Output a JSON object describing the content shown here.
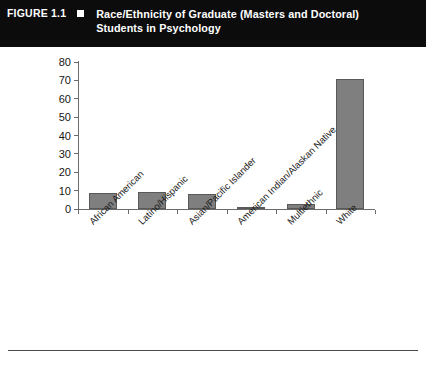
{
  "figure": {
    "number": "FIGURE 1.1",
    "bullet_icon": "square-bullet-icon",
    "title": "Race/Ethnicity of Graduate (Masters and Doctoral) Students in Psychology",
    "title_line_1": "Race/Ethnicity of Graduate (Masters and Doctoral)",
    "title_line_2": "Students in Psychology",
    "banner_background": "#0c0c0c",
    "banner_text_color": "#ffffff"
  },
  "chart_data": {
    "type": "bar",
    "title": "Race/Ethnicity of Graduate (Masters and Doctoral) Students in Psychology",
    "categories": [
      "African American",
      "Latino/Hispanic",
      "Asian/Pacific Islander",
      "American Indian/Alaskan Native",
      "Multiethnic",
      "White"
    ],
    "values": [
      8.5,
      9,
      8,
      0.8,
      3,
      71
    ],
    "xlabel": "",
    "ylabel": "",
    "ylim": [
      0,
      80
    ],
    "yticks": [
      0,
      10,
      20,
      30,
      40,
      50,
      60,
      70,
      80
    ],
    "ytick_labels": [
      "0",
      "10",
      "20",
      "30",
      "40",
      "50",
      "60",
      "70",
      "80"
    ],
    "grid": false,
    "legend": false,
    "bar_color": "#7f7f7f",
    "bar_border_color": "#595959",
    "axis_color": "#6b6b6b",
    "xlabel_rotation": -45
  }
}
